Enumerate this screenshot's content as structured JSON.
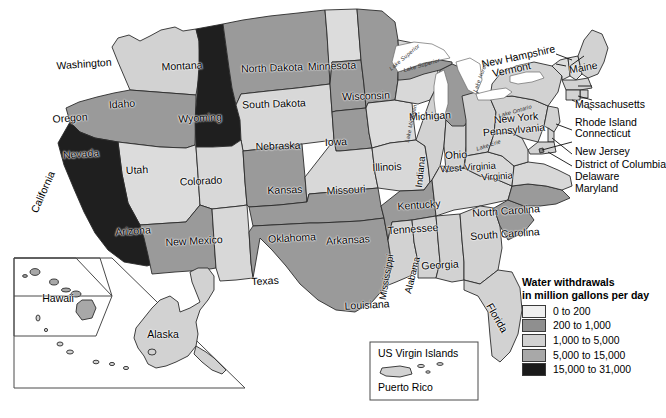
{
  "map": {
    "title": "Water withdrawals in million gallons per day",
    "projection_note": "contiguous United States with Alaska, Hawaii, Puerto Rico and US Virgin Islands insets"
  },
  "legend": {
    "title_line1": "Water withdrawals",
    "title_line2": "in million gallons per day",
    "entries": [
      {
        "label": "0 to 200",
        "color": "#efefef"
      },
      {
        "label": "200 to 1,000",
        "color": "#8f8f8f"
      },
      {
        "label": "1,000 to 5,000",
        "color": "#d2d2d2"
      },
      {
        "label": "5,000 to 15,000",
        "color": "#a8a8a8"
      },
      {
        "label": "15,000 to 31,000",
        "color": "#1a1a1a"
      }
    ]
  },
  "insets": {
    "hawaii_alaska": {
      "hawaii_label": "Hawaii",
      "alaska_label": "Alaska"
    },
    "caribbean": {
      "line1": "US Virgin Islands",
      "line2": "Puerto Rico"
    }
  },
  "lakes": [
    {
      "name": "Lake Superior"
    },
    {
      "name": "Lake Michigan"
    },
    {
      "name": "Lake Huron"
    },
    {
      "name": "Lake Erie"
    },
    {
      "name": "Lake Ontario"
    }
  ],
  "states": [
    {
      "name": "Washington",
      "class": "0 to 200",
      "color": "#d2d2d2"
    },
    {
      "name": "Oregon",
      "class": "200 to 1,000",
      "color": "#9a9a9a"
    },
    {
      "name": "Idaho",
      "class": "15,000 to 31,000",
      "color": "#1f1f1f"
    },
    {
      "name": "Montana",
      "class": "200 to 1,000",
      "color": "#9a9a9a"
    },
    {
      "name": "Wyoming",
      "class": "0 to 200",
      "color": "#d8d8d8"
    },
    {
      "name": "North Dakota",
      "class": "0 to 200",
      "color": "#dcdcdc"
    },
    {
      "name": "South Dakota",
      "class": "200 to 1,000",
      "color": "#9a9a9a"
    },
    {
      "name": "Minnesota",
      "class": "200 to 1,000",
      "color": "#9a9a9a"
    },
    {
      "name": "Wisconsin",
      "class": "0 to 200",
      "color": "#d8d8d8"
    },
    {
      "name": "Michigan",
      "class": "200 to 1,000",
      "color": "#9a9a9a"
    },
    {
      "name": "Iowa",
      "class": "0 to 200",
      "color": "#dcdcdc"
    },
    {
      "name": "Illinois",
      "class": "0 to 200",
      "color": "#d2d2d2"
    },
    {
      "name": "Indiana",
      "class": "0 to 200",
      "color": "#d2d2d2"
    },
    {
      "name": "Ohio",
      "class": "0 to 200",
      "color": "#d2d2d2"
    },
    {
      "name": "Nebraska",
      "class": "200 to 1,000",
      "color": "#9a9a9a"
    },
    {
      "name": "Kansas",
      "class": "0 to 200",
      "color": "#d8d8d8"
    },
    {
      "name": "Missouri",
      "class": "0 to 200",
      "color": "#d8d8d8"
    },
    {
      "name": "Nevada",
      "class": "0 to 200",
      "color": "#dcdcdc"
    },
    {
      "name": "Utah",
      "class": "0 to 200",
      "color": "#d8d8d8"
    },
    {
      "name": "California",
      "class": "15,000 to 31,000",
      "color": "#1f1f1f"
    },
    {
      "name": "Colorado",
      "class": "200 to 1,000",
      "color": "#9a9a9a"
    },
    {
      "name": "Arizona",
      "class": "200 to 1,000",
      "color": "#9a9a9a"
    },
    {
      "name": "New Mexico",
      "class": "0 to 200",
      "color": "#d8d8d8"
    },
    {
      "name": "Oklahoma",
      "class": "200 to 1,000",
      "color": "#9a9a9a"
    },
    {
      "name": "Texas",
      "class": "200 to 1,000",
      "color": "#9a9a9a"
    },
    {
      "name": "Arkansas",
      "class": "200 to 1,000",
      "color": "#9a9a9a"
    },
    {
      "name": "Louisiana",
      "class": "0 to 200",
      "color": "#d2d2d2"
    },
    {
      "name": "Mississippi",
      "class": "0 to 200",
      "color": "#d2d2d2"
    },
    {
      "name": "Alabama",
      "class": "0 to 200",
      "color": "#d2d2d2"
    },
    {
      "name": "Tennessee",
      "class": "0 to 200",
      "color": "#d8d8d8"
    },
    {
      "name": "Kentucky",
      "class": "0 to 200",
      "color": "#d8d8d8"
    },
    {
      "name": "Georgia",
      "class": "0 to 200",
      "color": "#d2d2d2"
    },
    {
      "name": "Florida",
      "class": "0 to 200",
      "color": "#d2d2d2"
    },
    {
      "name": "South Carolina",
      "class": "200 to 1,000",
      "color": "#9a9a9a"
    },
    {
      "name": "North Carolina",
      "class": "200 to 1,000",
      "color": "#9a9a9a"
    },
    {
      "name": "Virginia",
      "class": "0 to 200",
      "color": "#d8d8d8"
    },
    {
      "name": "West Virginia",
      "class": "0 to 200",
      "color": "#d8d8d8"
    },
    {
      "name": "Pennsylvania",
      "class": "0 to 200",
      "color": "#d2d2d2"
    },
    {
      "name": "New York",
      "class": "0 to 200",
      "color": "#d2d2d2"
    },
    {
      "name": "Vermont",
      "class": "0 to 200",
      "color": "#dcdcdc"
    },
    {
      "name": "New Hampshire",
      "class": "0 to 200",
      "color": "#dcdcdc"
    },
    {
      "name": "Maine",
      "class": "0 to 200",
      "color": "#d2d2d2"
    },
    {
      "name": "Massachusetts",
      "class": "0 to 200",
      "color": "#d2d2d2"
    },
    {
      "name": "Rhode Island",
      "class": "0 to 200",
      "color": "#d2d2d2"
    },
    {
      "name": "Connecticut",
      "class": "0 to 200",
      "color": "#d2d2d2"
    },
    {
      "name": "New Jersey",
      "class": "0 to 200",
      "color": "#d2d2d2"
    },
    {
      "name": "District of Columbia",
      "class": "0 to 200",
      "color": "#d2d2d2"
    },
    {
      "name": "Delaware",
      "class": "0 to 200",
      "color": "#d2d2d2"
    },
    {
      "name": "Maryland",
      "class": "0 to 200",
      "color": "#d2d2d2"
    },
    {
      "name": "Alaska",
      "class": "0 to 200",
      "color": "#d2d2d2"
    },
    {
      "name": "Hawaii",
      "class": "0 to 200",
      "color": "#a8a8a8"
    },
    {
      "name": "Puerto Rico",
      "class": "0 to 200",
      "color": "#d2d2d2"
    }
  ],
  "callout_labels": [
    "New Hampshire",
    "Vermont",
    "Maine",
    "Massachusetts",
    "Rhode Island",
    "Connecticut",
    "New Jersey",
    "District of Columbia",
    "Delaware",
    "Maryland"
  ]
}
